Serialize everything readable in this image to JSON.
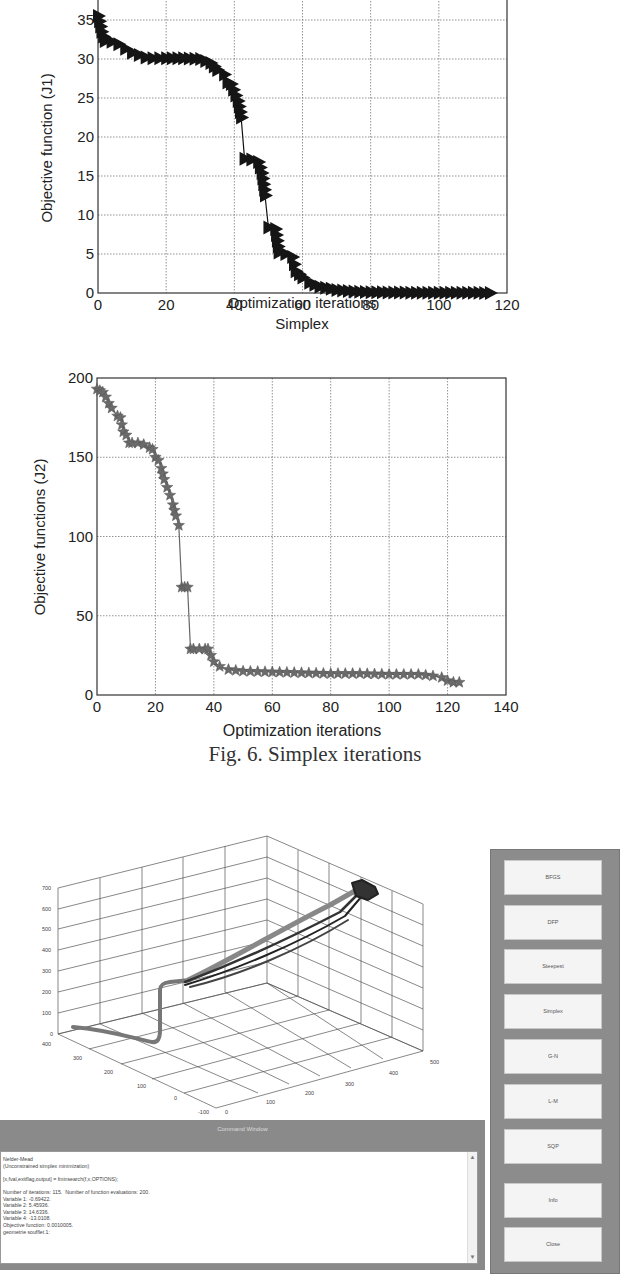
{
  "chart_data": [
    {
      "type": "line",
      "title": "",
      "xlabel": "Optimization iterations",
      "ylabel": "Objective function (J1)",
      "xlim": [
        0,
        120
      ],
      "ylim": [
        0,
        37
      ],
      "xticks": [
        "0",
        "20",
        "40",
        "60",
        "80",
        "100",
        "120"
      ],
      "yticks": [
        "0",
        "5",
        "10",
        "15",
        "20",
        "25",
        "30",
        "35"
      ],
      "grid": true,
      "marker": "right-triangle",
      "series": [
        {
          "name": "J1",
          "x": [
            0,
            1,
            2,
            4,
            6,
            8,
            10,
            12,
            14,
            16,
            20,
            25,
            30,
            33,
            35,
            37,
            38,
            39,
            41,
            42,
            43,
            45,
            47,
            48,
            49,
            50,
            52,
            53,
            55,
            57,
            58,
            60,
            62,
            65,
            70,
            75,
            80,
            90,
            100,
            110,
            115
          ],
          "values": [
            35.5,
            33.5,
            32.3,
            32.2,
            31.9,
            31.3,
            30.8,
            30.5,
            30.2,
            30.1,
            30.1,
            30.1,
            30.0,
            29.5,
            28.6,
            28.0,
            27.0,
            26.8,
            24.6,
            22.5,
            17.2,
            17.1,
            16.8,
            15.4,
            12.5,
            8.4,
            8.2,
            5.2,
            5.0,
            4.6,
            2.8,
            2.0,
            1.3,
            0.8,
            0.4,
            0.2,
            0.1,
            0.05,
            0.03,
            0.02,
            0.01
          ]
        }
      ]
    },
    {
      "type": "line",
      "title": "Simplex",
      "xlabel": "Optimization iterations",
      "ylabel": "Objective functions (J2)",
      "xlim": [
        0,
        140
      ],
      "ylim": [
        0,
        200
      ],
      "xticks": [
        "0",
        "20",
        "40",
        "60",
        "80",
        "100",
        "140"
      ],
      "xtick_values": [
        0,
        20,
        40,
        60,
        80,
        100,
        120,
        140
      ],
      "xtick_labels": [
        "0",
        "20",
        "40",
        "60",
        "80",
        "100",
        "120",
        "140"
      ],
      "yticks": [
        "0",
        "50",
        "100",
        "150",
        "200"
      ],
      "grid": true,
      "marker": "star",
      "series": [
        {
          "name": "J2",
          "x": [
            0,
            1,
            2,
            3,
            4,
            5,
            7,
            8,
            9,
            10,
            11,
            12,
            14,
            16,
            18,
            19,
            20,
            21,
            22,
            23,
            24,
            25,
            26,
            27,
            28,
            29,
            30,
            31,
            32,
            33,
            35,
            37,
            38,
            40,
            42,
            45,
            50,
            60,
            70,
            80,
            90,
            100,
            110,
            115,
            118,
            120,
            122,
            124
          ],
          "values": [
            193,
            192,
            191,
            188,
            184,
            181,
            176,
            175,
            166,
            164,
            159,
            159,
            159,
            158,
            156,
            155,
            150,
            148,
            143,
            136,
            131,
            126,
            120,
            113,
            107,
            68,
            68,
            68,
            29,
            29,
            29,
            29,
            29,
            21,
            18,
            16,
            15,
            14.5,
            14,
            13.5,
            13.5,
            13,
            13,
            12,
            11,
            9,
            8,
            8
          ]
        }
      ]
    },
    {
      "type": "line3d",
      "title": "",
      "z_ticks": [
        "0",
        "100",
        "200",
        "300",
        "400",
        "500",
        "600",
        "700"
      ],
      "y_ticks": [
        "400",
        "300",
        "200",
        "100",
        "0",
        "-100"
      ],
      "x_ticks": [
        "0",
        "100",
        "200",
        "300",
        "400",
        "500"
      ],
      "grid": true,
      "description": "3D trajectory: starts near (y=400,z~50), descends to z~0, rises vertically to z~250, then multiple bundled paths rise diagonally to a cluster near x~450, z~550"
    }
  ],
  "figure": {
    "caption": "Fig. 6. Simplex iterations"
  },
  "command_window": {
    "title": "Command Window",
    "lines": [
      "Nelder-Mead",
      "(Unconstrained simplex minimization)",
      "",
      "[x,fval,exitflag,output] = fminsearch(f,x,OPTIONS);",
      "",
      "Number of iterations: 115.  Number of function evaluations: 200.",
      "Variable 1: -0.69422.",
      "Variable 2: 5.45936.",
      "Variable 3: 14.6336.",
      "Variable 4: -13.0108.",
      "Objective function: 0.0010005.",
      "geometrie soufflet 1:"
    ],
    "scroll_up": "▲",
    "scroll_down": "▼"
  },
  "button_panel": {
    "buttons": [
      {
        "label": "BFGS"
      },
      {
        "label": "DFP"
      },
      {
        "label": "Steepest"
      },
      {
        "label": "Simplex"
      },
      {
        "label": "G-N"
      },
      {
        "label": "L-M"
      },
      {
        "label": "SQP"
      },
      {
        "label": "Info"
      },
      {
        "label": "Close"
      }
    ]
  }
}
